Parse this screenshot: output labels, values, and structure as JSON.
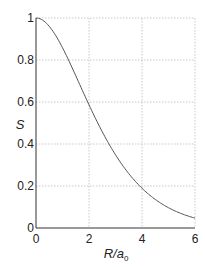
{
  "chart_data": {
    "type": "line",
    "title": "",
    "xlabel": "R/a0",
    "xlabel_main": "R/a",
    "xlabel_sub": "0",
    "ylabel": "S",
    "xlim": [
      0,
      6
    ],
    "ylim": [
      0,
      1
    ],
    "xticks": [
      0,
      2,
      4,
      6
    ],
    "yticks": [
      0,
      0.2,
      0.4,
      0.6,
      0.8,
      1
    ],
    "xtick_labels": [
      "0",
      "2",
      "4",
      "6"
    ],
    "ytick_labels": [
      "0",
      "0.2",
      "0.4",
      "0.6",
      "0.8",
      "1"
    ],
    "grid": true,
    "legend": null,
    "series": [
      {
        "name": "S",
        "x": [
          0,
          0.5,
          1,
          1.5,
          2,
          2.5,
          3,
          3.5,
          4,
          4.5,
          5,
          5.5,
          6
        ],
        "values": [
          1.0,
          0.96,
          0.86,
          0.73,
          0.59,
          0.46,
          0.35,
          0.26,
          0.19,
          0.13,
          0.1,
          0.07,
          0.05
        ]
      }
    ],
    "colors": {
      "line": "#555555",
      "grid": "#c8c8c8",
      "axis": "#333333"
    }
  }
}
